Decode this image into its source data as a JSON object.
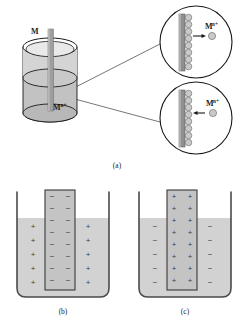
{
  "figure": {
    "panels": [
      {
        "id": "a",
        "caption": "(a)"
      },
      {
        "id": "b",
        "caption": "(b)"
      },
      {
        "id": "c",
        "caption": "(c)"
      }
    ]
  },
  "panel_a": {
    "electrode_label": "M",
    "solution_label_base": "M",
    "solution_label_sup": "n+",
    "inset_top": {
      "ion_label_base": "M",
      "ion_label_sup": "n+",
      "arrow_direction": "right",
      "surface_circle_count": 8
    },
    "inset_bottom": {
      "ion_label_base": "M",
      "ion_label_sup": "n+",
      "arrow_direction": "left",
      "surface_circle_count": 8
    }
  },
  "panel_b": {
    "electrode_charge": "−",
    "solution_charge": "+",
    "electrode_rows": 8,
    "solution_rows": 5
  },
  "panel_c": {
    "electrode_charge": "+",
    "solution_charge": "−",
    "electrode_rows": 8,
    "solution_rows": 5
  },
  "colors": {
    "outline": "#1a1a1a",
    "electrode_fill": "#9a9a9a",
    "solution_fill": "#cfcfcf",
    "beaker_fill": "#c2c2c2",
    "beaker_top_fill": "#d8d8d8",
    "ion_fill": "#c9c9c9",
    "background": "#ffffff"
  }
}
